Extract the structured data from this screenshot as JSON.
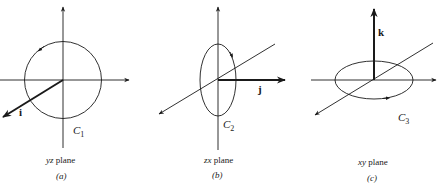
{
  "figure": {
    "panels": [
      {
        "id": "a",
        "tag": "(a)",
        "plane_var": "yz",
        "plane_word": " plane",
        "vector": "i",
        "curve": "C",
        "curve_sub": "1",
        "curve_shape": "circle",
        "orientation": "counterclockwise"
      },
      {
        "id": "b",
        "tag": "(b)",
        "plane_var": "zx",
        "plane_word": " plane",
        "vector": "j",
        "curve": "C",
        "curve_sub": "2",
        "curve_shape": "vertical-ellipse",
        "orientation": "counterclockwise"
      },
      {
        "id": "c",
        "tag": "(c)",
        "plane_var": "xy",
        "plane_word": " plane",
        "vector": "k",
        "curve": "C",
        "curve_sub": "3",
        "curve_shape": "horizontal-ellipse",
        "orientation": "counterclockwise"
      }
    ],
    "colors": {
      "line": "#1a1a1a",
      "background": "#ffffff"
    }
  }
}
